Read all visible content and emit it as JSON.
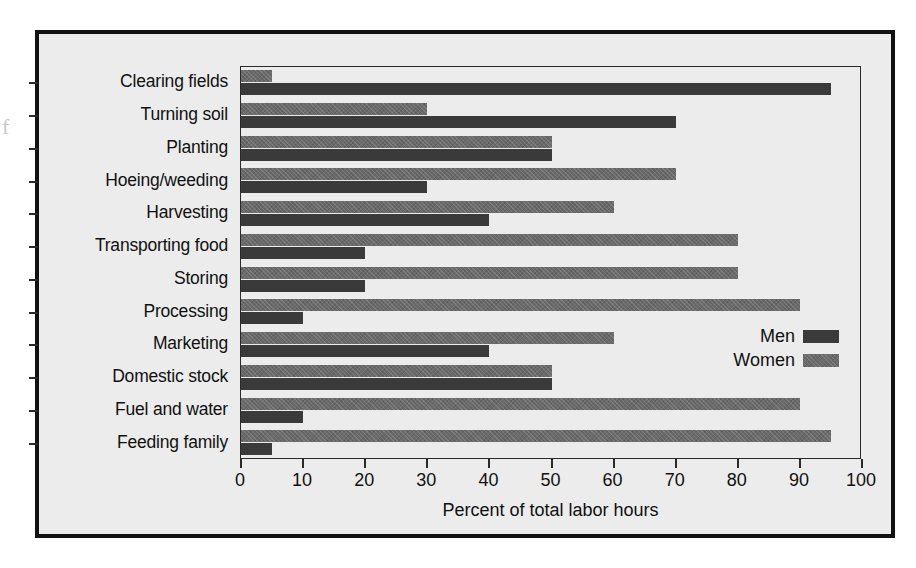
{
  "chart_data": {
    "type": "bar",
    "orientation": "horizontal",
    "title": "",
    "xlabel": "Percent of total labor hours",
    "ylabel": "",
    "xlim": [
      0,
      100
    ],
    "xticks": [
      0,
      10,
      20,
      30,
      40,
      50,
      60,
      70,
      80,
      90,
      100
    ],
    "grid": false,
    "legend_position": "inside-right",
    "categories": [
      "Clearing fields",
      "Turning soil",
      "Planting",
      "Hoeing/weeding",
      "Harvesting",
      "Transporting food",
      "Storing",
      "Processing",
      "Marketing",
      "Domestic stock",
      "Fuel and water",
      "Feeding family"
    ],
    "series": [
      {
        "name": "Women",
        "color": "#6a6a6a",
        "values": [
          5,
          30,
          50,
          70,
          60,
          80,
          80,
          90,
          60,
          50,
          90,
          95
        ]
      },
      {
        "name": "Men",
        "color": "#3a3a3a",
        "values": [
          95,
          70,
          50,
          30,
          40,
          20,
          20,
          10,
          40,
          50,
          10,
          5
        ]
      }
    ]
  },
  "legend": {
    "entries": [
      {
        "label": "Men",
        "swatch": "men"
      },
      {
        "label": "Women",
        "swatch": "women"
      }
    ]
  },
  "figure": {
    "background_color": "#ececec",
    "frame_color": "#111111",
    "edge_artifact": "f"
  }
}
